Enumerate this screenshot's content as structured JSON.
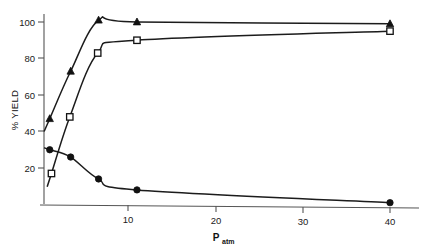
{
  "chart_data": {
    "type": "line",
    "title": "",
    "xlabel": "P_atm",
    "xlabel_main": "P",
    "xlabel_sub": "atm",
    "ylabel": "% YIELD",
    "xlim": [
      0,
      42
    ],
    "ylim": [
      0,
      105
    ],
    "grid": false,
    "legend": "none",
    "xticks": [
      10,
      20,
      30,
      40
    ],
    "xtick_labels": [
      "10",
      "20",
      "30",
      "40"
    ],
    "yticks": [
      20,
      40,
      60,
      80,
      100
    ],
    "ytick_labels": [
      "20",
      "40",
      "60",
      "80",
      "100"
    ],
    "series": [
      {
        "name": "filled-triangle-series",
        "marker": "filled-triangle",
        "color": "#111111",
        "x": [
          1.0,
          3.4,
          6.6,
          11.0,
          40.0
        ],
        "y": [
          47,
          73,
          101,
          100,
          99
        ]
      },
      {
        "name": "open-square-series",
        "marker": "open-square",
        "color": "#111111",
        "x": [
          1.2,
          3.3,
          6.5,
          11.0,
          40.0
        ],
        "y": [
          17,
          48,
          83,
          90,
          95
        ]
      },
      {
        "name": "filled-circle-series",
        "marker": "filled-circle",
        "color": "#111111",
        "x": [
          1.0,
          3.4,
          6.6,
          11.0,
          40.0
        ],
        "y": [
          30,
          26,
          14,
          8,
          1
        ]
      }
    ]
  },
  "axes": {
    "y_axis_label": "% YIELD",
    "x_axis_label_main": "P",
    "x_axis_label_sub": "atm"
  }
}
